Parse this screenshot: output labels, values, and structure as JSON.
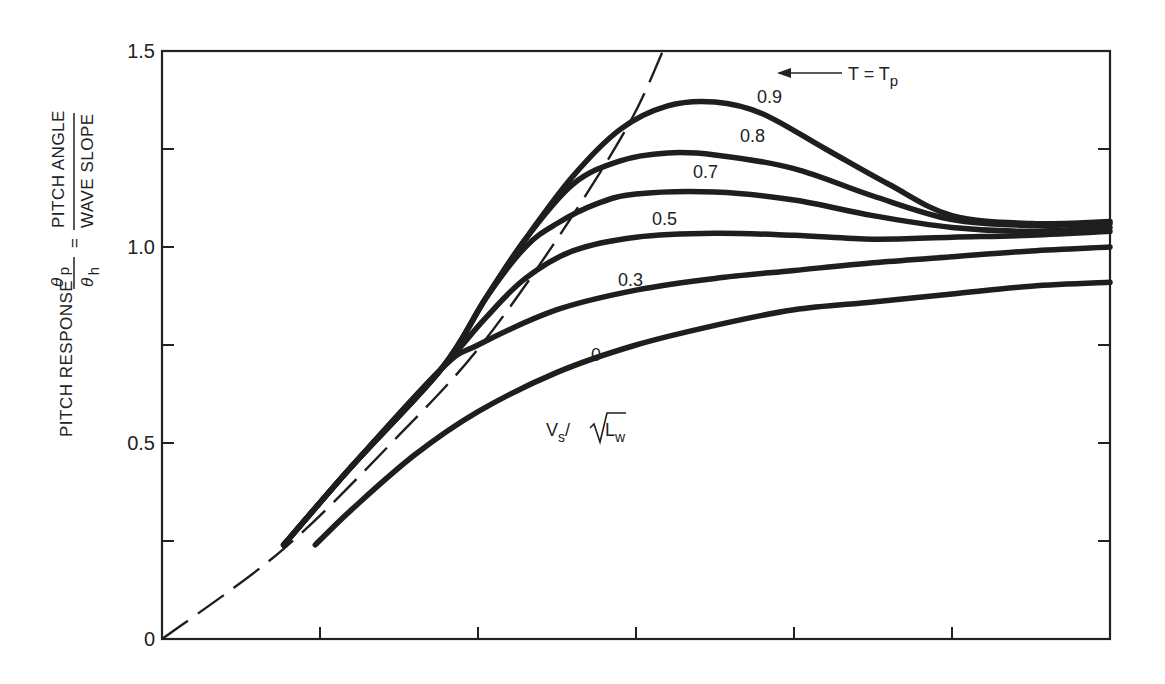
{
  "chart_data": {
    "type": "line",
    "title": "",
    "xlabel": "",
    "ylabel": "PITCH RESPONSE θp/θh = PITCH ANGLE / WAVE SLOPE",
    "ylabel_parts": {
      "prefix": "PITCH RESPONSE",
      "num_symbol": "θ",
      "num_sub": "p",
      "den_symbol": "θ",
      "den_sub": "h",
      "equals": "=",
      "num_text": "PITCH ANGLE",
      "den_text": "WAVE SLOPE"
    },
    "xlim": [
      0,
      6
    ],
    "ylim": [
      0,
      1.5
    ],
    "x_ticks": [
      1,
      2,
      3,
      4,
      5
    ],
    "x_tick_labels": [],
    "y_ticks": [
      0,
      0.25,
      0.5,
      0.75,
      1.0,
      1.25,
      1.5
    ],
    "y_tick_labels": [
      "0",
      "0.5",
      "1.0",
      "1.5"
    ],
    "grid": false,
    "legend_title": "Vs/√Lw",
    "legend_title_parts": {
      "v": "V",
      "v_sub": "s",
      "slash": "/",
      "l": "L",
      "l_sub": "w"
    },
    "annotation": {
      "text": "T = T",
      "sub": "p",
      "target": "dashed line"
    },
    "series": [
      {
        "name": "T = Tp",
        "style": "dashed",
        "x": [
          0,
          0.77,
          1.5,
          2.0,
          2.5,
          2.95,
          3.17
        ],
        "y": [
          0,
          0.23,
          0.52,
          0.74,
          1.02,
          1.31,
          1.5
        ]
      },
      {
        "name": "0",
        "style": "solid",
        "x": [
          0.97,
          1.2,
          1.6,
          2.0,
          2.5,
          3.0,
          3.5,
          4.0,
          4.5,
          5.0,
          5.5,
          6.0
        ],
        "y": [
          0.24,
          0.33,
          0.47,
          0.58,
          0.68,
          0.75,
          0.8,
          0.84,
          0.86,
          0.88,
          0.9,
          0.91
        ]
      },
      {
        "name": "0.3",
        "style": "solid",
        "x": [
          0.77,
          1.2,
          1.77,
          2.0,
          2.5,
          3.0,
          3.5,
          4.0,
          4.5,
          5.0,
          5.5,
          6.0
        ],
        "y": [
          0.24,
          0.44,
          0.69,
          0.75,
          0.84,
          0.89,
          0.92,
          0.94,
          0.96,
          0.975,
          0.99,
          1.0
        ]
      },
      {
        "name": "0.5",
        "style": "solid",
        "x": [
          0.77,
          1.2,
          1.77,
          2.05,
          2.3,
          2.6,
          3.0,
          3.5,
          4.0,
          4.5,
          5.0,
          5.5,
          6.0
        ],
        "y": [
          0.24,
          0.44,
          0.69,
          0.82,
          0.92,
          0.99,
          1.025,
          1.035,
          1.03,
          1.02,
          1.025,
          1.03,
          1.04
        ]
      },
      {
        "name": "0.7",
        "style": "solid",
        "x": [
          0.77,
          1.2,
          1.77,
          2.05,
          2.3,
          2.5,
          2.75,
          3.0,
          3.5,
          4.0,
          4.5,
          5.0,
          5.5,
          6.0
        ],
        "y": [
          0.24,
          0.44,
          0.69,
          0.87,
          1.0,
          1.06,
          1.11,
          1.135,
          1.14,
          1.12,
          1.08,
          1.05,
          1.04,
          1.05
        ]
      },
      {
        "name": "0.8",
        "style": "solid",
        "x": [
          0.77,
          1.2,
          1.77,
          2.05,
          2.3,
          2.6,
          2.9,
          3.2,
          3.5,
          4.0,
          4.5,
          5.0,
          5.5,
          6.0
        ],
        "y": [
          0.24,
          0.44,
          0.69,
          0.87,
          1.02,
          1.16,
          1.22,
          1.24,
          1.235,
          1.2,
          1.13,
          1.07,
          1.055,
          1.06
        ]
      },
      {
        "name": "0.9",
        "style": "solid",
        "x": [
          0.77,
          1.2,
          1.77,
          2.05,
          2.3,
          2.6,
          2.9,
          3.2,
          3.5,
          3.8,
          4.2,
          4.6,
          5.0,
          5.5,
          6.0
        ],
        "y": [
          0.24,
          0.44,
          0.69,
          0.87,
          1.02,
          1.18,
          1.3,
          1.36,
          1.37,
          1.34,
          1.25,
          1.16,
          1.08,
          1.06,
          1.065
        ]
      }
    ],
    "curve_labels": [
      "0.9",
      "0.8",
      "0.7",
      "0.5",
      "0.3",
      "0"
    ]
  }
}
